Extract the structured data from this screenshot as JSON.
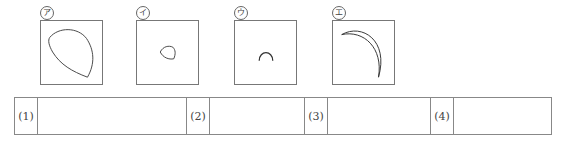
{
  "figures": [
    {
      "label": "ア",
      "shape": "lens-large"
    },
    {
      "label": "イ",
      "shape": "lens-small"
    },
    {
      "label": "ウ",
      "shape": "arc-small"
    },
    {
      "label": "エ",
      "shape": "crescent"
    }
  ],
  "answer_table": {
    "items": [
      {
        "number": "(1)",
        "answer": ""
      },
      {
        "number": "(2)",
        "answer": ""
      },
      {
        "number": "(3)",
        "answer": ""
      },
      {
        "number": "(4)",
        "answer": ""
      }
    ]
  }
}
